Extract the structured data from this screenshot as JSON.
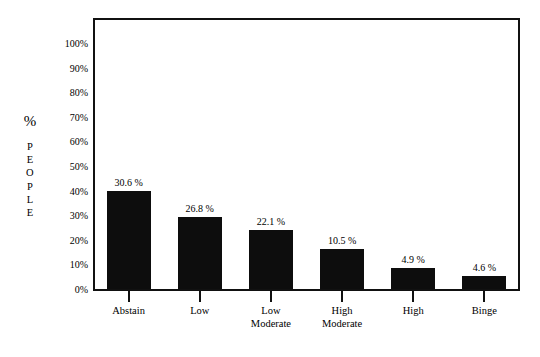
{
  "chart_data": {
    "type": "bar",
    "title": "",
    "subtitle": "",
    "xlabel": "",
    "ylabel": "% PEOPLE",
    "ylim": [
      0,
      100
    ],
    "grid": false,
    "legend": null,
    "categories": [
      "Abstain",
      "Low",
      "Low Moderate",
      "High Moderate",
      "High",
      "Binge"
    ],
    "values": [
      30.6,
      26.8,
      22.1,
      10.5,
      4.9,
      4.6
    ],
    "value_labels": [
      "30.6 %",
      "26.8 %",
      "22.1 %",
      "10.5 %",
      "4.9 %",
      "4.6 %"
    ],
    "bar_color": "#0d0d0d",
    "axis_color": "#111111",
    "background_color": "#ffffff",
    "y_ticks": [
      "0%",
      "10%",
      "20%",
      "30%",
      "40%",
      "50%",
      "60%",
      "70%",
      "80%",
      "90%",
      "100%"
    ],
    "y_tick_values": [
      0,
      10,
      20,
      30,
      40,
      50,
      60,
      70,
      80,
      90,
      100
    ],
    "plotted_heights_percent": [
      39.9,
      29.4,
      23.8,
      16.1,
      8.5,
      5.2
    ]
  },
  "axis_title": {
    "percent_symbol": "%",
    "stacked_word": [
      "P",
      "E",
      "O",
      "P",
      "L",
      "E"
    ]
  },
  "categories_display": [
    {
      "line1": "Abstain",
      "line2": ""
    },
    {
      "line1": "Low",
      "line2": ""
    },
    {
      "line1": "Low",
      "line2": "Moderate"
    },
    {
      "line1": "High",
      "line2": "Moderate"
    },
    {
      "line1": "High",
      "line2": ""
    },
    {
      "line1": "Binge",
      "line2": ""
    }
  ]
}
